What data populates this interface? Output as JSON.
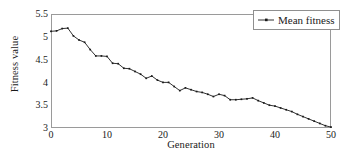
{
  "chart_data": {
    "type": "line",
    "title": "",
    "xlabel": "Generation",
    "ylabel": "Fitness value",
    "xlim": [
      0,
      50
    ],
    "ylim": [
      3,
      5.5
    ],
    "xticks": [
      0,
      10,
      20,
      30,
      40,
      50
    ],
    "xtick_labels": [
      "0",
      "10",
      "20",
      "30",
      "40",
      "50"
    ],
    "yticks": [
      3,
      3.5,
      4,
      4.5,
      5,
      5.5
    ],
    "ytick_labels": [
      "3",
      "3.5",
      "4",
      "4.5",
      "5",
      "5.5"
    ],
    "grid": false,
    "legend_position": "top-right",
    "line_color": "#1a1a1a",
    "marker": "dot",
    "series": [
      {
        "name": "Mean fitness",
        "x": [
          0,
          1,
          2,
          3,
          4,
          5,
          6,
          7,
          8,
          9,
          10,
          11,
          12,
          13,
          14,
          15,
          16,
          17,
          18,
          19,
          20,
          21,
          22,
          23,
          24,
          25,
          26,
          27,
          28,
          29,
          30,
          31,
          32,
          33,
          34,
          35,
          36,
          37,
          38,
          39,
          40,
          41,
          42,
          43,
          44,
          45,
          46,
          47,
          48,
          49,
          50
        ],
        "values": [
          5.12,
          5.13,
          5.18,
          5.19,
          5.02,
          4.93,
          4.88,
          4.72,
          4.58,
          4.58,
          4.57,
          4.42,
          4.41,
          4.31,
          4.3,
          4.24,
          4.18,
          4.09,
          4.14,
          4.05,
          4.0,
          4.0,
          3.91,
          3.82,
          3.88,
          3.84,
          3.8,
          3.78,
          3.74,
          3.69,
          3.74,
          3.71,
          3.62,
          3.62,
          3.63,
          3.64,
          3.66,
          3.6,
          3.55,
          3.5,
          3.48,
          3.44,
          3.4,
          3.36,
          3.3,
          3.25,
          3.2,
          3.15,
          3.1,
          3.05,
          3.02
        ]
      }
    ]
  },
  "legend": {
    "entries": [
      {
        "label": "Mean fitness",
        "marker": "line-with-dot"
      }
    ]
  },
  "axes": {
    "x_axis_label": "Generation",
    "y_axis_label": "Fitness value"
  }
}
